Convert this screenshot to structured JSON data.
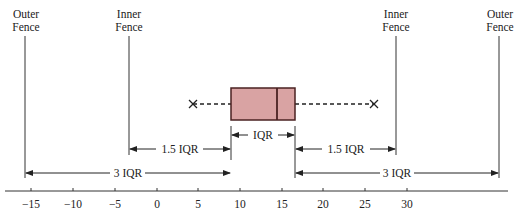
{
  "diagram": {
    "type": "boxplot-fences",
    "fences": {
      "outer_left": {
        "label_line1": "Outer",
        "label_line2": "Fence",
        "value": -15.8
      },
      "inner_left": {
        "label_line1": "Inner",
        "label_line2": "Fence",
        "value": -3.5
      },
      "inner_right": {
        "label_line1": "Inner",
        "label_line2": "Fence",
        "value": 31.0
      },
      "outer_right": {
        "label_line1": "Outer",
        "label_line2": "Fence",
        "value": 41.2
      }
    },
    "box": {
      "q1": 8.9,
      "median": 14.2,
      "q3": 16.4,
      "whisker_low": 4.2,
      "whisker_high": 25.9,
      "fill": "#d9a3a3",
      "stroke": "#4a2222"
    },
    "annotations": {
      "iqr": "IQR",
      "inner_left": "1.5 IQR",
      "inner_right": "1.5 IQR",
      "outer_left": "3 IQR",
      "outer_right": "3 IQR"
    },
    "axis": {
      "ticks": [
        "−15",
        "−10",
        "−5",
        "0",
        "5",
        "10",
        "15",
        "20",
        "25",
        "30"
      ],
      "tick_values": [
        -15,
        -10,
        -5,
        0,
        5,
        10,
        15,
        20,
        25,
        30
      ]
    }
  }
}
